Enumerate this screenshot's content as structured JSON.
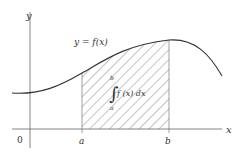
{
  "diagram": {
    "type": "definite-integral-area",
    "axes": {
      "x_label": "x",
      "y_label": "y",
      "origin_label": "0"
    },
    "curve": {
      "label": "y = f(x)",
      "color": "#333333"
    },
    "bounds": {
      "lower": "a",
      "upper": "b"
    },
    "integral": {
      "upper_limit": "b",
      "lower_limit": "a",
      "integrand": "f (x) dx"
    },
    "shading": {
      "pattern": "diagonal-hatch",
      "color": "#555555"
    }
  }
}
